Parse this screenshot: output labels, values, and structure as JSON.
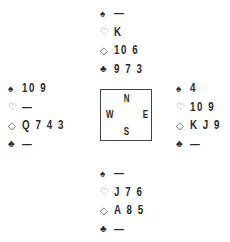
{
  "hands": {
    "north": {
      "spades": "—",
      "hearts": "K",
      "diamonds": "10 6",
      "clubs": "9 7 3"
    },
    "west": {
      "spades": "10 9",
      "hearts": "—",
      "diamonds": "Q 7 4 3",
      "clubs": "—"
    },
    "east": {
      "spades": "4",
      "hearts": "10 9",
      "diamonds": "K J 9",
      "clubs": "—"
    },
    "south": {
      "spades": "—",
      "hearts": "J 7 6",
      "diamonds": "A 8 5",
      "clubs": "—"
    }
  },
  "suit_symbols": {
    "spades": "♠",
    "hearts": "♡",
    "diamonds": "◇",
    "clubs": "♣"
  },
  "compass": {
    "north": "N",
    "south": "S",
    "west": "W",
    "east": "E"
  }
}
